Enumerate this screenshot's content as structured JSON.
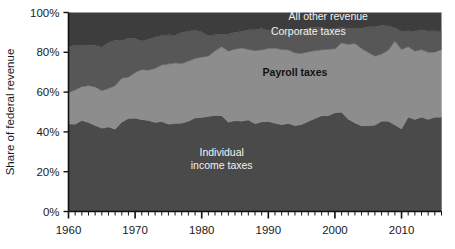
{
  "chart_data": {
    "type": "area",
    "subtype": "stacked-area-100pct",
    "title": "",
    "subtitle": "",
    "xlabel": "",
    "ylabel": "Share of federal revenue",
    "xlim": [
      1960,
      2016
    ],
    "ylim": [
      0,
      100
    ],
    "grid": false,
    "legend_position": "inline-annotations",
    "y_ticks": [
      0,
      20,
      40,
      60,
      80,
      100
    ],
    "y_tick_labels": [
      "0%",
      "20%",
      "40%",
      "60%",
      "80%",
      "100%"
    ],
    "x_ticks": [
      1960,
      1970,
      1980,
      1990,
      2000,
      2010
    ],
    "x_tick_labels": [
      "1960",
      "1970",
      "1980",
      "1990",
      "2000",
      "2010"
    ],
    "x_minor_tick_interval": 1,
    "stack_order_bottom_to_top": [
      "Individual income taxes",
      "Payroll taxes",
      "Corporate taxes",
      "All other revenue"
    ],
    "x": [
      1960,
      1961,
      1962,
      1963,
      1964,
      1965,
      1966,
      1967,
      1968,
      1969,
      1970,
      1971,
      1972,
      1973,
      1974,
      1975,
      1976,
      1977,
      1978,
      1979,
      1980,
      1981,
      1982,
      1983,
      1984,
      1985,
      1986,
      1987,
      1988,
      1989,
      1990,
      1991,
      1992,
      1993,
      1994,
      1995,
      1996,
      1997,
      1998,
      1999,
      2000,
      2001,
      2002,
      2003,
      2004,
      2005,
      2006,
      2007,
      2008,
      2009,
      2010,
      2011,
      2012,
      2013,
      2014,
      2015,
      2016
    ],
    "series": [
      {
        "name": "Individual income taxes",
        "color": "#4a4a4a",
        "label_color": "#f2f2f2",
        "values": [
          44.0,
          43.8,
          45.7,
          44.7,
          43.2,
          41.8,
          42.4,
          41.3,
          44.9,
          46.7,
          46.9,
          46.1,
          45.7,
          44.7,
          45.2,
          43.9,
          44.2,
          44.3,
          45.3,
          47.0,
          47.2,
          47.7,
          48.2,
          48.1,
          44.8,
          45.6,
          45.4,
          46.0,
          44.1,
          45.0,
          45.2,
          44.3,
          43.6,
          44.2,
          43.1,
          43.7,
          45.2,
          46.7,
          48.1,
          48.1,
          49.6,
          49.9,
          46.3,
          44.5,
          43.0,
          43.1,
          43.4,
          45.3,
          45.4,
          43.5,
          41.5,
          47.4,
          46.2,
          47.4,
          46.2,
          47.4,
          47.3
        ]
      },
      {
        "name": "Payroll taxes",
        "color": "#8d8d8d",
        "label_color": "#121212",
        "values": [
          15.9,
          17.4,
          17.1,
          18.6,
          19.5,
          19.0,
          19.5,
          22.0,
          22.2,
          20.9,
          23.0,
          25.3,
          25.4,
          27.3,
          28.5,
          30.3,
          30.5,
          30.2,
          30.3,
          30.0,
          30.5,
          30.5,
          32.6,
          34.8,
          35.9,
          36.1,
          36.9,
          35.5,
          36.8,
          36.3,
          36.8,
          37.9,
          37.9,
          37.1,
          36.7,
          35.8,
          35.1,
          34.2,
          33.2,
          33.5,
          32.2,
          34.9,
          37.8,
          40.0,
          39.0,
          36.9,
          34.8,
          33.9,
          35.7,
          42.3,
          40.0,
          35.5,
          34.5,
          34.0,
          33.9,
          32.8,
          34.1
        ]
      },
      {
        "name": "Corporate taxes",
        "color": "#575757",
        "label_color": "#f2f2f2",
        "values": [
          23.2,
          22.2,
          20.6,
          20.3,
          20.9,
          21.8,
          23.0,
          22.8,
          18.7,
          19.6,
          17.0,
          14.3,
          15.5,
          15.7,
          14.7,
          14.6,
          13.9,
          15.4,
          15.0,
          14.2,
          12.5,
          10.2,
          8.0,
          6.2,
          8.5,
          8.4,
          8.2,
          9.8,
          10.4,
          10.6,
          9.1,
          9.3,
          9.2,
          10.2,
          11.2,
          11.6,
          11.8,
          11.5,
          11.0,
          10.1,
          10.2,
          7.6,
          8.0,
          7.4,
          10.1,
          12.9,
          14.7,
          14.4,
          12.1,
          6.6,
          8.9,
          7.9,
          9.9,
          9.9,
          10.6,
          10.6,
          9.2
        ]
      },
      {
        "name": "All other revenue",
        "color": "#3d3d3d",
        "label_color": "#f2f2f2",
        "values": [
          16.9,
          16.6,
          16.6,
          16.4,
          16.4,
          17.4,
          15.1,
          13.9,
          14.2,
          12.8,
          13.1,
          14.3,
          13.4,
          12.3,
          11.6,
          11.2,
          11.4,
          10.1,
          9.4,
          8.8,
          9.8,
          11.6,
          11.2,
          10.9,
          10.8,
          9.9,
          9.5,
          8.7,
          8.7,
          8.1,
          8.9,
          8.5,
          9.3,
          8.5,
          9.0,
          8.9,
          7.9,
          7.6,
          7.7,
          8.3,
          8.0,
          7.6,
          7.9,
          8.1,
          7.9,
          7.1,
          7.1,
          6.4,
          6.8,
          7.6,
          9.6,
          9.2,
          9.4,
          8.7,
          9.3,
          9.2,
          9.4
        ]
      }
    ],
    "annotations": [
      {
        "text": "All other revenue",
        "x_year": 1999,
        "y_pct": 96.0,
        "align": "middle",
        "style": "light"
      },
      {
        "text": "Corporate taxes",
        "x_year": 1996,
        "y_pct": 88.5,
        "align": "middle",
        "style": "light"
      },
      {
        "text": "Payroll taxes",
        "x_year": 1994,
        "y_pct": 68.0,
        "align": "middle",
        "style": "dark"
      },
      {
        "text": "Individual",
        "x_year": 1983,
        "y_pct": 28.0,
        "align": "middle",
        "style": "light"
      },
      {
        "text": "income taxes",
        "x_year": 1983,
        "y_pct": 21.5,
        "align": "middle",
        "style": "light"
      }
    ]
  },
  "axis": {
    "y_title": "Share of federal revenue",
    "y_labels": [
      "100%",
      "80%",
      "60%",
      "40%",
      "20%",
      "0%"
    ],
    "x_labels": [
      "1960",
      "1970",
      "1980",
      "1990",
      "2000",
      "2010"
    ]
  },
  "colors": {
    "background": "#ffffff",
    "axis": "#111111",
    "individual_income_taxes": "#4a4a4a",
    "payroll_taxes": "#8d8d8d",
    "corporate_taxes": "#575757",
    "all_other_revenue": "#3d3d3d"
  }
}
